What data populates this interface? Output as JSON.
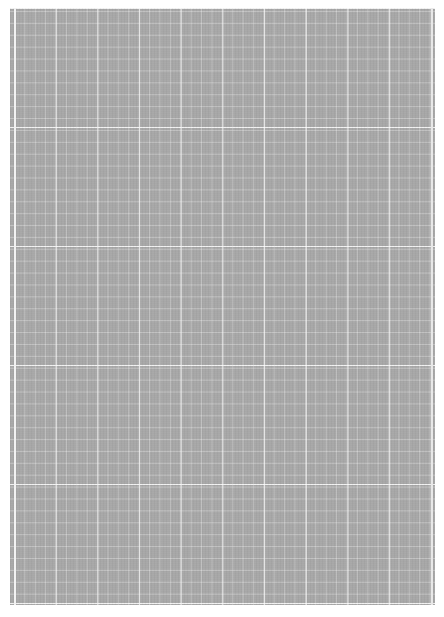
{
  "page": {
    "type": "grid-paper-sheet",
    "background_color": "#a7a7a7",
    "grid_line_color": "#ffffff",
    "major_columns": 10,
    "major_rows": 5
  }
}
